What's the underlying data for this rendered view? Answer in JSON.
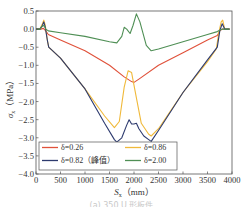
{
  "chart_data": {
    "type": "line",
    "title": "",
    "xlabel": "S_x (mm)",
    "ylabel": "σ_x (MPa)",
    "xlim": [
      0,
      4000
    ],
    "ylim": [
      -4.0,
      0.5
    ],
    "xticks": [
      0,
      500,
      1000,
      1500,
      2000,
      2500,
      3000,
      3500,
      4000
    ],
    "yticks": [
      0.5,
      0.0,
      -0.5,
      -1.0,
      -1.5,
      -2.0,
      -2.5,
      -3.0,
      -3.5,
      -4.0
    ],
    "ytick_labels": [
      "0.5",
      "0.0",
      "−0.5",
      "−1.0",
      "−1.5",
      "−2.0",
      "−2.5",
      "−3.0",
      "−3.5",
      "−4.0"
    ],
    "grid": false,
    "legend_position": "lower-left, inside, 2 columns",
    "series": [
      {
        "name": "δ=0.26",
        "color": "#e0513a",
        "x": [
          0,
          100,
          150,
          200,
          250,
          500,
          1000,
          1500,
          1800,
          1950,
          2000,
          2100,
          2500,
          3000,
          3500,
          3700,
          3750,
          3800,
          3850,
          3950
        ],
        "y": [
          0.0,
          0.0,
          0.02,
          -0.05,
          -0.15,
          -0.3,
          -0.6,
          -1.0,
          -1.32,
          -1.45,
          -1.47,
          -1.38,
          -1.0,
          -0.65,
          -0.3,
          -0.18,
          -0.05,
          0.0,
          0.0,
          0.0
        ]
      },
      {
        "name": "δ=0.86",
        "color": "#f0b93a",
        "x": [
          0,
          80,
          130,
          160,
          190,
          230,
          260,
          500,
          1000,
          1400,
          1600,
          1700,
          1800,
          1880,
          1950,
          2050,
          2150,
          2300,
          2350,
          2500,
          3000,
          3500,
          3680,
          3730,
          3780,
          3810,
          3850,
          3950
        ],
        "y": [
          0.0,
          0.0,
          0.15,
          0.25,
          0.1,
          -0.3,
          -0.5,
          -0.8,
          -1.65,
          -2.4,
          -2.72,
          -2.55,
          -1.6,
          -1.15,
          -1.2,
          -1.9,
          -2.6,
          -2.9,
          -2.95,
          -2.75,
          -1.75,
          -0.9,
          -0.55,
          -0.1,
          0.2,
          0.25,
          0.0,
          0.0
        ]
      },
      {
        "name": "δ=0.82（峰值）",
        "color": "#2d3a6e",
        "x": [
          0,
          80,
          130,
          160,
          190,
          230,
          260,
          500,
          1000,
          1400,
          1600,
          1650,
          1750,
          1850,
          1900,
          1950,
          2000,
          2050,
          2100,
          2200,
          2300,
          2350,
          2500,
          3000,
          3500,
          3700,
          3750,
          3800,
          3850,
          3950
        ],
        "y": [
          0.0,
          0.0,
          0.1,
          0.2,
          0.05,
          -0.3,
          -0.5,
          -0.8,
          -1.65,
          -2.6,
          -3.05,
          -3.12,
          -3.0,
          -2.65,
          -2.5,
          -2.62,
          -2.62,
          -2.6,
          -2.75,
          -2.95,
          -3.05,
          -3.1,
          -2.8,
          -1.75,
          -0.85,
          -0.5,
          -0.05,
          0.15,
          0.0,
          0.0
        ]
      },
      {
        "name": "δ=2.00",
        "color": "#4f8f55",
        "x": [
          0,
          80,
          130,
          160,
          200,
          250,
          500,
          1000,
          1500,
          1650,
          1750,
          1800,
          1850,
          1920,
          1980,
          2050,
          2120,
          2250,
          2350,
          2500,
          3000,
          3500,
          3700,
          3750,
          3800,
          3850,
          3950
        ],
        "y": [
          0.0,
          0.0,
          0.08,
          0.1,
          0.0,
          -0.05,
          -0.1,
          -0.2,
          -0.35,
          -0.38,
          -0.2,
          0.05,
          0.0,
          -0.12,
          0.1,
          0.42,
          0.2,
          -0.45,
          -0.6,
          -0.55,
          -0.35,
          -0.15,
          -0.07,
          -0.03,
          0.0,
          0.0,
          0.0
        ]
      }
    ]
  },
  "axes": {
    "ylabel_sigma": "σ",
    "ylabel_sub": "x",
    "ylabel_unit": "（MPa）",
    "xlabel_s": "S",
    "xlabel_sub": "x",
    "xlabel_unit": "（mm）"
  },
  "legend": {
    "items": [
      {
        "label": "δ=0.26",
        "color": "#e0513a"
      },
      {
        "label": "δ=0.86",
        "color": "#f0b93a"
      },
      {
        "label": "δ=0.82（峰值）",
        "color": "#2d3a6e"
      },
      {
        "label": "δ=2.00",
        "color": "#4f8f55"
      }
    ]
  },
  "caption": "(a) 350 U 形板件"
}
